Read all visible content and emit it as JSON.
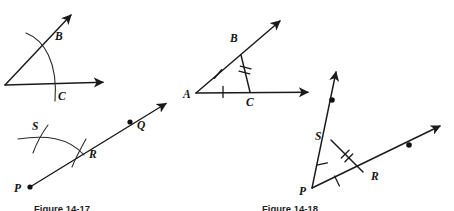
{
  "page": {
    "background_color": "#ffffff",
    "ink_color": "#1a1a1a",
    "width": 454,
    "height": 211
  },
  "captions": {
    "left": "Figure 14-17",
    "right": "Figure 14-18"
  },
  "figures": [
    {
      "id": "fig-angle-arc-bc",
      "name": "angle-with-arc-b-c",
      "description": "Angle with vertex at lower left; an arc struck from the vertex crosses the upper ray at B and the lower ray at C.",
      "vertex": {
        "x": 5,
        "y": 85
      },
      "rays": [
        {
          "name": "horizontal-ray",
          "to": {
            "x": 107,
            "y": 82
          },
          "arrow": true
        },
        {
          "name": "diagonal-ray",
          "to": {
            "x": 74,
            "y": 11
          },
          "arrow": true
        }
      ],
      "points": [
        {
          "label": "B",
          "x": 45,
          "y": 42,
          "label_x": 55,
          "label_y": 40,
          "dot": false
        },
        {
          "label": "C",
          "x": 53,
          "y": 88,
          "label_x": 58,
          "label_y": 100,
          "dot": false
        }
      ],
      "arcs": [
        {
          "name": "construction-arc",
          "d": "M 26 33 C 44 40 58 62 55 101"
        }
      ],
      "ticks": []
    },
    {
      "id": "fig-ray-pqr-arcs",
      "name": "ray-p-q-with-arcs-r-s",
      "description": "Ray from P through R and Q; an arc crosses the ray at R and a second short arc crosses the first arc at S.",
      "vertex": {
        "x": 30,
        "y": 187
      },
      "rays": [
        {
          "name": "ray-p-q",
          "to": {
            "x": 170,
            "y": 100
          },
          "arrow": true
        }
      ],
      "points": [
        {
          "label": "P",
          "x": 30,
          "y": 187,
          "label_x": 14,
          "label_y": 192,
          "dot": true
        },
        {
          "label": "Q",
          "x": 130,
          "y": 122,
          "label_x": 137,
          "label_y": 129,
          "dot": true
        },
        {
          "label": "R",
          "x": 80,
          "y": 148,
          "label_x": 89,
          "label_y": 158,
          "dot": false
        },
        {
          "label": "S",
          "x": 40,
          "y": 133,
          "label_x": 32,
          "label_y": 130,
          "dot": false
        }
      ],
      "arcs": [
        {
          "name": "arc-from-p",
          "d": "M 18 139 C 45 135 68 137 84 155"
        },
        {
          "name": "arc-crossing-at-s",
          "d": "M 48 125 C 42 133 37 142 33 153"
        },
        {
          "name": "arc-crossing-at-r",
          "d": "M 86 139 C 81 148 76 157 72 167"
        }
      ],
      "ticks": []
    },
    {
      "id": "fig-triangle-abc",
      "name": "angle-a-with-chord-bc",
      "description": "Angle with vertex A; B on the upper ray and C on the lower ray, joined by chord BC. AB and AC carry single tick marks; BC carries a double tick mark.",
      "vertex": {
        "x": 196,
        "y": 93
      },
      "rays": [
        {
          "name": "horizontal-ray-a",
          "to": {
            "x": 312,
            "y": 92
          },
          "arrow": true
        },
        {
          "name": "diagonal-ray-a",
          "to": {
            "x": 283,
            "y": 17
          },
          "arrow": true
        }
      ],
      "points": [
        {
          "label": "A",
          "x": 196,
          "y": 93,
          "label_x": 183,
          "label_y": 98,
          "dot": false
        },
        {
          "label": "B",
          "x": 241,
          "y": 55,
          "label_x": 230,
          "label_y": 42,
          "dot": false
        },
        {
          "label": "C",
          "x": 250,
          "y": 92,
          "label_x": 248,
          "label_y": 106,
          "dot": false
        }
      ],
      "segments": [
        {
          "name": "segment-bc",
          "from": {
            "x": 241,
            "y": 55
          },
          "to": {
            "x": 250,
            "y": 92
          }
        }
      ],
      "ticks": [
        {
          "name": "tick-ab",
          "count": 1,
          "x": 218,
          "y": 74,
          "angle": 40
        },
        {
          "name": "tick-ac",
          "count": 1,
          "x": 223,
          "y": 92,
          "angle": 90
        },
        {
          "name": "tick-bc",
          "count": 2,
          "x": 246,
          "y": 73,
          "angle": 104
        }
      ],
      "arcs": []
    },
    {
      "id": "fig-triangle-psr",
      "name": "angle-p-with-chord-sr",
      "description": "Angle with vertex P; S on the steep ray and R on the shallow ray, joined by chord SR. PS and PR carry single tick marks; SR carries a double tick mark. Both rays carry a marked dot beyond S and R.",
      "vertex": {
        "x": 312,
        "y": 188
      },
      "rays": [
        {
          "name": "steep-ray-p",
          "to": {
            "x": 337,
            "y": 68
          },
          "arrow": true
        },
        {
          "name": "shallow-ray-p",
          "to": {
            "x": 444,
            "y": 124
          },
          "arrow": true
        }
      ],
      "points": [
        {
          "label": "P",
          "x": 312,
          "y": 188,
          "label_x": 299,
          "label_y": 194,
          "dot": false
        },
        {
          "label": "S",
          "x": 331,
          "y": 140,
          "label_x": 316,
          "label_y": 139,
          "dot": false
        },
        {
          "label": "R",
          "x": 363,
          "y": 172,
          "label_x": 371,
          "label_y": 180,
          "dot": false
        },
        {
          "label": "",
          "x": 332,
          "y": 100,
          "label_x": 0,
          "label_y": 0,
          "dot": true
        },
        {
          "label": "",
          "x": 409,
          "y": 145,
          "label_x": 0,
          "label_y": 0,
          "dot": true
        }
      ],
      "segments": [
        {
          "name": "segment-sr",
          "from": {
            "x": 331,
            "y": 140
          },
          "to": {
            "x": 363,
            "y": 172
          }
        }
      ],
      "ticks": [
        {
          "name": "tick-ps",
          "count": 1,
          "x": 322,
          "y": 164,
          "angle": 78
        },
        {
          "name": "tick-pr",
          "count": 1,
          "x": 337,
          "y": 180,
          "angle": 18
        },
        {
          "name": "tick-sr",
          "count": 2,
          "x": 347,
          "y": 156,
          "angle": 45
        }
      ],
      "arcs": []
    }
  ]
}
